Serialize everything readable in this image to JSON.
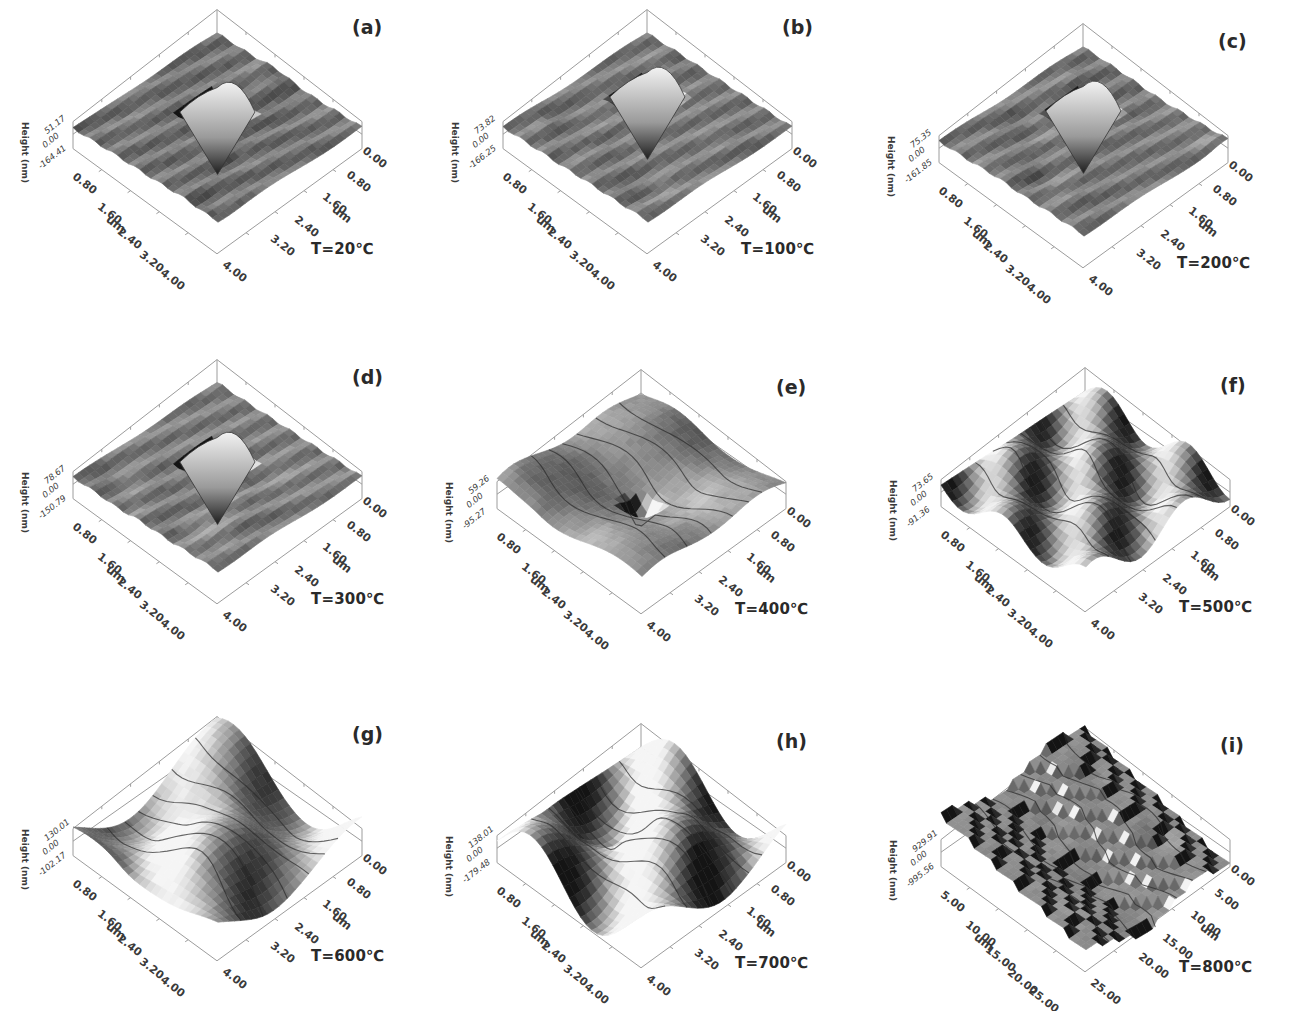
{
  "figure": {
    "height_axis_label": "Height (nm)",
    "xy_unit": "um"
  },
  "chart_data": [
    {
      "type": "heatmap",
      "panel": "(a)",
      "temperature": "T=20℃",
      "zlabel": "Height (nm)",
      "z_ticks": [
        "51.17",
        "0.00",
        "-164.41"
      ],
      "z_range": [
        -164.41,
        51.17
      ],
      "x_ticks": [
        "0.80",
        "1.60",
        "2.40",
        "3.20",
        "4.00"
      ],
      "y_ticks": [
        "0.00",
        "0.80",
        "1.60",
        "2.40",
        "3.20",
        "4.00"
      ],
      "xlabel": "um",
      "ylabel": "um",
      "xy_range": [
        0,
        4
      ],
      "feature": "pyramidal indent, flat surface"
    },
    {
      "type": "heatmap",
      "panel": "(b)",
      "temperature": "T=100℃",
      "zlabel": "Height (nm)",
      "z_ticks": [
        "73.82",
        "0.00",
        "-166.25"
      ],
      "z_range": [
        -166.25,
        73.82
      ],
      "x_ticks": [
        "0.80",
        "1.60",
        "2.40",
        "3.20",
        "4.00"
      ],
      "y_ticks": [
        "0.00",
        "0.80",
        "1.60",
        "2.40",
        "3.20",
        "4.00"
      ],
      "xlabel": "um",
      "ylabel": "um",
      "xy_range": [
        0,
        4
      ],
      "feature": "pyramidal indent, flat surface"
    },
    {
      "type": "heatmap",
      "panel": "(c)",
      "temperature": "T=200℃",
      "zlabel": "Height (nm)",
      "z_ticks": [
        "75.35",
        "0.00",
        "-161.85"
      ],
      "z_range": [
        -161.85,
        75.35
      ],
      "x_ticks": [
        "0.80",
        "1.60",
        "2.40",
        "3.20",
        "4.00"
      ],
      "y_ticks": [
        "0.00",
        "0.80",
        "1.60",
        "2.40",
        "3.20",
        "4.00"
      ],
      "xlabel": "um",
      "ylabel": "um",
      "xy_range": [
        0,
        4
      ],
      "feature": "pyramidal indent, flat surface"
    },
    {
      "type": "heatmap",
      "panel": "(d)",
      "temperature": "T=300℃",
      "zlabel": "Height (nm)",
      "z_ticks": [
        "78.67",
        "0.00",
        "-150.79"
      ],
      "z_range": [
        -150.79,
        78.67
      ],
      "x_ticks": [
        "0.80",
        "1.60",
        "2.40",
        "3.20",
        "4.00"
      ],
      "y_ticks": [
        "0.00",
        "0.80",
        "1.60",
        "2.40",
        "3.20",
        "4.00"
      ],
      "xlabel": "um",
      "ylabel": "um",
      "xy_range": [
        0,
        4
      ],
      "feature": "pyramidal indent, rougher surface"
    },
    {
      "type": "heatmap",
      "panel": "(e)",
      "temperature": "T=400℃",
      "zlabel": "Height (nm)",
      "z_ticks": [
        "59.26",
        "0.00",
        "-95.27"
      ],
      "z_range": [
        -95.27,
        59.26
      ],
      "x_ticks": [
        "0.80",
        "1.60",
        "2.40",
        "3.20",
        "4.00"
      ],
      "y_ticks": [
        "0.00",
        "0.80",
        "1.60",
        "2.40",
        "3.20",
        "4.00"
      ],
      "xlabel": "um",
      "ylabel": "um",
      "xy_range": [
        0,
        4
      ],
      "feature": "shallow indent, wavy surface"
    },
    {
      "type": "heatmap",
      "panel": "(f)",
      "temperature": "T=500℃",
      "zlabel": "Height (nm)",
      "z_ticks": [
        "73.65",
        "0.00",
        "-91.36"
      ],
      "z_range": [
        -91.36,
        73.65
      ],
      "x_ticks": [
        "0.80",
        "1.60",
        "2.40",
        "3.20",
        "4.00"
      ],
      "y_ticks": [
        "0.00",
        "0.80",
        "1.60",
        "2.40",
        "3.20",
        "4.00"
      ],
      "xlabel": "um",
      "ylabel": "um",
      "xy_range": [
        0,
        4
      ],
      "feature": "grain/ridge topography"
    },
    {
      "type": "heatmap",
      "panel": "(g)",
      "temperature": "T=600℃",
      "zlabel": "Height (nm)",
      "z_ticks": [
        "130.01",
        "0.00",
        "-102.17"
      ],
      "z_range": [
        -102.17,
        130.01
      ],
      "x_ticks": [
        "0.80",
        "1.60",
        "2.40",
        "3.20",
        "4.00"
      ],
      "y_ticks": [
        "0.00",
        "0.80",
        "1.60",
        "2.40",
        "3.20",
        "4.00"
      ],
      "xlabel": "um",
      "ylabel": "um",
      "xy_range": [
        0,
        4
      ],
      "feature": "coarse grain topography"
    },
    {
      "type": "heatmap",
      "panel": "(h)",
      "temperature": "T=700℃",
      "zlabel": "Height (nm)",
      "z_ticks": [
        "138.01",
        "0.00",
        "-179.48"
      ],
      "z_range": [
        -179.48,
        138.01
      ],
      "x_ticks": [
        "0.80",
        "1.60",
        "2.40",
        "3.20",
        "4.00"
      ],
      "y_ticks": [
        "0.00",
        "0.80",
        "1.60",
        "2.40",
        "3.20",
        "4.00"
      ],
      "xlabel": "um",
      "ylabel": "um",
      "xy_range": [
        0,
        4
      ],
      "feature": "coarse grain topography with ridges"
    },
    {
      "type": "heatmap",
      "panel": "(i)",
      "temperature": "T=800℃",
      "zlabel": "Height (nm)",
      "z_ticks": [
        "929.91",
        "0.00",
        "-995.56"
      ],
      "z_range": [
        -995.56,
        929.91
      ],
      "x_ticks": [
        "5.00",
        "10.00",
        "15.00",
        "20.00",
        "25.00"
      ],
      "y_ticks": [
        "0.00",
        "5.00",
        "10.00",
        "15.00",
        "20.00",
        "25.00"
      ],
      "xlabel": "um",
      "ylabel": "um",
      "xy_range": [
        0,
        25
      ],
      "feature": "very rough terraced topography"
    }
  ],
  "panels": [
    {
      "label": "(a)",
      "temp": "T=20℃",
      "zmax": "51.17",
      "zmin": "-164.41",
      "zero": "0.00",
      "unit": "um",
      "left": [
        "0.80",
        "1.60",
        "2.40",
        "3.20",
        "4.00"
      ],
      "right": [
        "0.80",
        "1.60",
        "2.40",
        "3.20",
        "4.00"
      ],
      "zero_r": "0.00",
      "haxis": "Height (nm)",
      "style": "indent",
      "shade": 0.45
    },
    {
      "label": "(b)",
      "temp": "T=100℃",
      "zmax": "73.82",
      "zmin": "-166.25",
      "zero": "0.00",
      "unit": "um",
      "left": [
        "0.80",
        "1.60",
        "2.40",
        "3.20",
        "4.00"
      ],
      "right": [
        "0.80",
        "1.60",
        "2.40",
        "3.20",
        "4.00"
      ],
      "zero_r": "0.00",
      "haxis": "Height (nm)",
      "style": "indent-top",
      "shade": 0.48
    },
    {
      "label": "(c)",
      "temp": "T=200℃",
      "zmax": "75.35",
      "zmin": "-161.85",
      "zero": "0.00",
      "unit": "um",
      "left": [
        "0.80",
        "1.60",
        "2.40",
        "3.20",
        "4.00"
      ],
      "right": [
        "0.80",
        "1.60",
        "2.40",
        "3.20",
        "4.00"
      ],
      "zero_r": "0.00",
      "haxis": "Height (nm)",
      "style": "indent-top",
      "shade": 0.48
    },
    {
      "label": "(d)",
      "temp": "T=300℃",
      "zmax": "78.67",
      "zmin": "-150.79",
      "zero": "0.00",
      "unit": "um",
      "left": [
        "0.80",
        "1.60",
        "2.40",
        "3.20",
        "4.00"
      ],
      "right": [
        "0.80",
        "1.60",
        "2.40",
        "3.20",
        "4.00"
      ],
      "zero_r": "0.00",
      "haxis": "Height (nm)",
      "style": "indent",
      "shade": 0.5
    },
    {
      "label": "(e)",
      "temp": "T=400℃",
      "zmax": "59.26",
      "zmin": "-95.27",
      "zero": "0.00",
      "unit": "um",
      "left": [
        "0.80",
        "1.60",
        "2.40",
        "3.20",
        "4.00"
      ],
      "right": [
        "0.80",
        "1.60",
        "2.40",
        "3.20",
        "4.00"
      ],
      "zero_r": "0.00",
      "haxis": "Height (nm)",
      "style": "wavy",
      "shade": 0.55
    },
    {
      "label": "(f)",
      "temp": "T=500℃",
      "zmax": "73.65",
      "zmin": "-91.36",
      "zero": "0.00",
      "unit": "um",
      "left": [
        "0.80",
        "1.60",
        "2.40",
        "3.20",
        "4.00"
      ],
      "right": [
        "0.80",
        "1.60",
        "2.40",
        "3.20",
        "4.00"
      ],
      "zero_r": "0.00",
      "haxis": "Height (nm)",
      "style": "grain",
      "shade": 0.55
    },
    {
      "label": "(g)",
      "temp": "T=600℃",
      "zmax": "130.01",
      "zmin": "-102.17",
      "zero": "0.00",
      "unit": "um",
      "left": [
        "0.80",
        "1.60",
        "2.40",
        "3.20",
        "4.00"
      ],
      "right": [
        "0.80",
        "1.60",
        "2.40",
        "3.20",
        "4.00"
      ],
      "zero_r": "0.00",
      "haxis": "Height (nm)",
      "style": "coarse",
      "shade": 0.65
    },
    {
      "label": "(h)",
      "temp": "T=700℃",
      "zmax": "138.01",
      "zmin": "-179.48",
      "zero": "0.00",
      "unit": "um",
      "left": [
        "0.80",
        "1.60",
        "2.40",
        "3.20",
        "4.00"
      ],
      "right": [
        "0.80",
        "1.60",
        "2.40",
        "3.20",
        "4.00"
      ],
      "zero_r": "0.00",
      "haxis": "Height (nm)",
      "style": "coarse2",
      "shade": 0.62
    },
    {
      "label": "(i)",
      "temp": "T=800℃",
      "zmax": "929.91",
      "zmin": "-995.56",
      "zero": "0.00",
      "unit": "um",
      "left": [
        "5.00",
        "10.00",
        "15.00",
        "20.00",
        "25.00"
      ],
      "right": [
        "5.00",
        "10.00",
        "15.00",
        "20.00",
        "25.00"
      ],
      "zero_r": "0.00",
      "haxis": "Height (nm)",
      "style": "terrace",
      "shade": 0.55
    }
  ]
}
